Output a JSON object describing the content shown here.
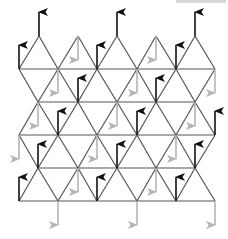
{
  "diagram": {
    "colors": {
      "background": "#ffffff",
      "edge": "#555555",
      "up_arrow": "#111111",
      "down_arrow": "#b5b5b5"
    },
    "geometry": {
      "col_step": 39.2,
      "row_ys": [
        36,
        69,
        102,
        135,
        168,
        201
      ],
      "even_xs": [
        19,
        58,
        97,
        137,
        176,
        215
      ],
      "odd_xs": [
        38,
        78,
        117,
        156,
        195
      ],
      "arrow_length": 24
    },
    "top_sawtooth": {
      "base_y": 69,
      "apex_y": 36,
      "apex_xs": [
        39,
        78,
        117,
        156,
        195
      ]
    },
    "up_arrows": [
      {
        "x": 39,
        "y": 36
      },
      {
        "x": 117,
        "y": 36
      },
      {
        "x": 195,
        "y": 36
      },
      {
        "x": 19,
        "y": 69
      },
      {
        "x": 97,
        "y": 69
      },
      {
        "x": 176,
        "y": 69
      },
      {
        "x": 78,
        "y": 102
      },
      {
        "x": 156,
        "y": 102
      },
      {
        "x": 58,
        "y": 135
      },
      {
        "x": 137,
        "y": 135
      },
      {
        "x": 215,
        "y": 135
      },
      {
        "x": 38,
        "y": 168
      },
      {
        "x": 117,
        "y": 168
      },
      {
        "x": 195,
        "y": 168
      },
      {
        "x": 19,
        "y": 201
      },
      {
        "x": 97,
        "y": 201
      },
      {
        "x": 176,
        "y": 201
      }
    ],
    "down_arrows": [
      {
        "x": 78,
        "y": 36
      },
      {
        "x": 156,
        "y": 36
      },
      {
        "x": 58,
        "y": 69
      },
      {
        "x": 137,
        "y": 69
      },
      {
        "x": 215,
        "y": 69
      },
      {
        "x": 38,
        "y": 102
      },
      {
        "x": 117,
        "y": 102
      },
      {
        "x": 195,
        "y": 102
      },
      {
        "x": 19,
        "y": 135
      },
      {
        "x": 97,
        "y": 135
      },
      {
        "x": 176,
        "y": 135
      },
      {
        "x": 78,
        "y": 168
      },
      {
        "x": 156,
        "y": 168
      },
      {
        "x": 58,
        "y": 201
      },
      {
        "x": 137,
        "y": 201
      },
      {
        "x": 215,
        "y": 201
      }
    ]
  }
}
